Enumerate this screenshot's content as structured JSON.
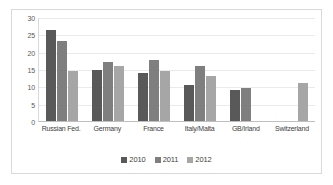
{
  "chart_data": {
    "type": "bar",
    "title": "",
    "xlabel": "",
    "ylabel": "",
    "ylim": [
      0,
      30
    ],
    "yticks": [
      30,
      25,
      20,
      15,
      10,
      5,
      0
    ],
    "grid": true,
    "legend_position": "bottom",
    "categories": [
      "Russian Fed.",
      "Germany",
      "France",
      "Italy/Malta",
      "GB/Irland",
      "Switzerland"
    ],
    "series": [
      {
        "name": "2010",
        "color": "#595959",
        "values": [
          26.3,
          14.8,
          13.8,
          10.5,
          9.0,
          null
        ]
      },
      {
        "name": "2011",
        "color": "#7f7f7f",
        "values": [
          23.0,
          17.0,
          17.5,
          15.8,
          9.4,
          null
        ]
      },
      {
        "name": "2012",
        "color": "#a6a6a6",
        "values": [
          14.4,
          15.8,
          14.4,
          13.1,
          null,
          10.9
        ]
      }
    ]
  },
  "axis": {
    "ticks": [
      {
        "label": "30"
      },
      {
        "label": "25"
      },
      {
        "label": "20"
      },
      {
        "label": "15"
      },
      {
        "label": "10"
      },
      {
        "label": "5"
      },
      {
        "label": "0"
      }
    ]
  },
  "categories": [
    {
      "label": "Russian Fed."
    },
    {
      "label": "Germany"
    },
    {
      "label": "France"
    },
    {
      "label": "Italy/Malta"
    },
    {
      "label": "GB/Irland"
    },
    {
      "label": "Switzerland"
    }
  ],
  "legend": {
    "items": [
      {
        "label": "2010"
      },
      {
        "label": "2011"
      },
      {
        "label": "2012"
      }
    ]
  }
}
